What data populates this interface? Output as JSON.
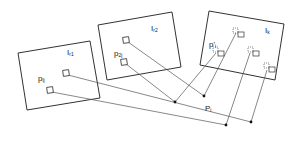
{
  "diagram": {
    "frames": [
      {
        "id": "I_r1",
        "label": "I",
        "sub": "r1",
        "points": "18,53 90,41 100,98 27,110",
        "label_x": 68,
        "label_y": 55
      },
      {
        "id": "I_r2",
        "label": "I",
        "sub": "r2",
        "points": "98,25 172,12 181,67 107,80",
        "label_x": 152,
        "label_y": 31
      },
      {
        "id": "I_k",
        "label": "I",
        "sub": "k",
        "points": "209,11 284,24 275,80 200,65",
        "label_x": 265,
        "label_y": 33
      }
    ],
    "labels": {
      "p_lj": {
        "main": "p",
        "sub": "lj",
        "x": 37,
        "y": 81
      },
      "p_2j": {
        "main": "p",
        "sub": "2j",
        "x": 113,
        "y": 56
      },
      "p_prime_i": {
        "main": "p'",
        "sub": "i",
        "x": 210,
        "y": 46
      },
      "P_i": {
        "main": "P",
        "sub": "i",
        "x": 205,
        "y": 111
      }
    },
    "colors": {
      "line": "#444444",
      "frame": "#333333",
      "dot": "#111111",
      "background": "#ffffff"
    }
  }
}
